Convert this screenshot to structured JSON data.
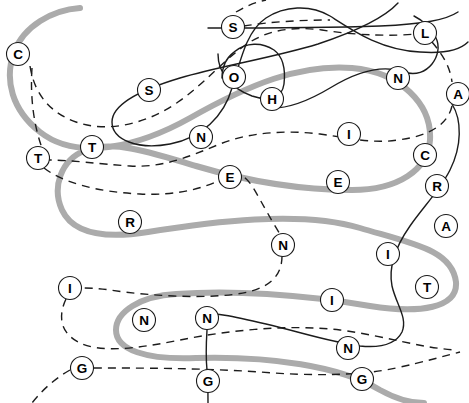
{
  "page": {
    "width": 469,
    "height": 403,
    "background_color": "#ffffff"
  },
  "legend": {
    "gray_thread_color": "#ababab",
    "black_thread_color": "#1c1c1c",
    "node_fill_color": "#ffffff",
    "node_stroke_color": "#1a1a1a"
  },
  "chart_data": {
    "type": "diagram",
    "node_radius": 11.5,
    "nodes": [
      {
        "id": "n01",
        "label": "C",
        "x": 18,
        "y": 54
      },
      {
        "id": "n02",
        "label": "S",
        "x": 233,
        "y": 27
      },
      {
        "id": "n03",
        "label": "L",
        "x": 425,
        "y": 33
      },
      {
        "id": "n04",
        "label": "S",
        "x": 149,
        "y": 90
      },
      {
        "id": "n05",
        "label": "O",
        "x": 234,
        "y": 77
      },
      {
        "id": "n06",
        "label": "H",
        "x": 272,
        "y": 99
      },
      {
        "id": "n07",
        "label": "N",
        "x": 398,
        "y": 78
      },
      {
        "id": "n08",
        "label": "A",
        "x": 458,
        "y": 94
      },
      {
        "id": "n09",
        "label": "T",
        "x": 92,
        "y": 147
      },
      {
        "id": "n10",
        "label": "N",
        "x": 201,
        "y": 137
      },
      {
        "id": "n11",
        "label": "I",
        "x": 349,
        "y": 134
      },
      {
        "id": "n12",
        "label": "T",
        "x": 38,
        "y": 158
      },
      {
        "id": "n13",
        "label": "C",
        "x": 425,
        "y": 155
      },
      {
        "id": "n14",
        "label": "E",
        "x": 230,
        "y": 177
      },
      {
        "id": "n15",
        "label": "E",
        "x": 338,
        "y": 182
      },
      {
        "id": "n16",
        "label": "R",
        "x": 437,
        "y": 186
      },
      {
        "id": "n17",
        "label": "R",
        "x": 130,
        "y": 222
      },
      {
        "id": "n18",
        "label": "A",
        "x": 446,
        "y": 226
      },
      {
        "id": "n19",
        "label": "N",
        "x": 283,
        "y": 245
      },
      {
        "id": "n20",
        "label": "I",
        "x": 388,
        "y": 254
      },
      {
        "id": "n21",
        "label": "I",
        "x": 70,
        "y": 288
      },
      {
        "id": "n22",
        "label": "I",
        "x": 332,
        "y": 300
      },
      {
        "id": "n23",
        "label": "T",
        "x": 427,
        "y": 287
      },
      {
        "id": "n24",
        "label": "N",
        "x": 144,
        "y": 320
      },
      {
        "id": "n25",
        "label": "N",
        "x": 207,
        "y": 318
      },
      {
        "id": "n26",
        "label": "N",
        "x": 348,
        "y": 348
      },
      {
        "id": "n27",
        "label": "G",
        "x": 82,
        "y": 368
      },
      {
        "id": "n28",
        "label": "G",
        "x": 208,
        "y": 381
      },
      {
        "id": "n29",
        "label": "G",
        "x": 362,
        "y": 379
      }
    ],
    "threads": [
      {
        "id": "gray-1",
        "style": "solid",
        "color": "#ababab",
        "width": 6,
        "path": "M 80 8 C 52 10, 24 26, 14 52 C 4 80, 12 110, 40 132 C 78 162, 140 146, 190 118 C 250 84, 300 64, 352 68 C 400 72, 432 104, 430 140 C 428 170, 398 190, 352 190 C 300 190, 250 182, 196 166 C 150 152, 112 140, 86 150 C 60 160, 52 188, 62 210 C 74 236, 110 238, 148 232 C 210 222, 300 210, 360 228 C 414 244, 452 250, 456 282 C 458 308, 420 314, 370 306 C 300 294, 230 290, 176 294 C 140 296, 116 312, 116 330 C 116 350, 146 360, 196 358 C 270 356, 340 366, 380 390 C 398 400, 412 403, 424 403"
      },
      {
        "id": "black-solid-1",
        "style": "solid",
        "color": "#1c1c1c",
        "width": 1.4,
        "path": "M 398 3 C 386 16, 360 30, 318 44 C 272 58, 220 66, 180 78 C 140 90, 112 104, 112 122 C 112 140, 138 150, 170 144 C 202 138, 224 116, 232 88 C 242 54, 248 30, 266 18 C 284 6, 310 4, 330 16 C 352 30, 380 50, 420 52 C 448 54, 462 48, 468 42"
      },
      {
        "id": "black-solid-2",
        "style": "solid",
        "color": "#1c1c1c",
        "width": 1.4,
        "path": "M 208 28 C 250 28, 320 28, 380 26 C 424 24, 446 20, 458 12"
      },
      {
        "id": "black-solid-3",
        "style": "solid",
        "color": "#1c1c1c",
        "width": 1.4,
        "path": "M 218 54 C 218 72, 230 88, 252 96 C 270 102, 282 98, 284 84 C 286 66, 282 56, 274 50 C 262 42, 246 42, 234 52 C 226 58, 222 66, 222 78"
      },
      {
        "id": "black-solid-4",
        "style": "solid",
        "color": "#1c1c1c",
        "width": 1.4,
        "path": "M 266 108 C 288 110, 310 100, 330 88 C 356 72, 382 64, 404 72 C 428 80, 444 54, 436 38 C 430 26, 422 20, 414 16"
      },
      {
        "id": "black-solid-5",
        "style": "solid",
        "color": "#1c1c1c",
        "width": 1.4,
        "path": "M 452 104 C 462 120, 462 146, 450 170 C 440 190, 424 206, 410 226 C 396 246, 388 266, 392 286 C 396 304, 408 318, 402 332 C 396 344, 380 348, 360 346 C 330 342, 300 332, 266 324 C 232 316, 212 312, 200 314"
      },
      {
        "id": "black-solid-6",
        "style": "solid",
        "color": "#1c1c1c",
        "width": 1.4,
        "path": "M 207 330 C 206 346, 206 360, 207 370 C 208 382, 208 394, 208 403"
      },
      {
        "id": "dash-1",
        "style": "dashed",
        "color": "#1c1c1c",
        "width": 1.4,
        "path": "M 30 66 C 34 92, 48 112, 76 122 C 110 134, 150 122, 178 102 C 204 84, 222 62, 244 46 C 266 30, 292 26, 322 30 C 360 36, 396 36, 416 34"
      },
      {
        "id": "dash-2",
        "style": "dashed",
        "color": "#1c1c1c",
        "width": 1.4,
        "path": "M 432 42 C 442 54, 450 66, 452 82"
      },
      {
        "id": "dash-3",
        "style": "dashed",
        "color": "#1c1c1c",
        "width": 1.4,
        "path": "M 452 106 C 448 124, 430 136, 398 140 C 372 144, 350 138, 320 134 C 286 130, 250 132, 220 144 C 190 156, 164 168, 130 166 C 98 164, 72 160, 48 160"
      },
      {
        "id": "dash-4",
        "style": "dashed",
        "color": "#1c1c1c",
        "width": 1.4,
        "path": "M 32 68 C 30 98, 34 126, 42 148"
      },
      {
        "id": "dash-5",
        "style": "dashed",
        "color": "#1c1c1c",
        "width": 1.4,
        "path": "M 44 168 C 62 182, 96 192, 140 194 C 176 196, 206 188, 224 178 C 240 168, 248 178, 258 196 C 268 214, 276 228, 280 234"
      },
      {
        "id": "dash-6",
        "style": "dashed",
        "color": "#1c1c1c",
        "width": 1.4,
        "path": "M 282 256 C 282 274, 272 286, 248 292 C 212 300, 150 296, 110 290 C 96 288, 86 288, 80 288"
      },
      {
        "id": "dash-7",
        "style": "dashed",
        "color": "#1c1c1c",
        "width": 1.4,
        "path": "M 66 299 C 58 316, 60 332, 78 342 C 100 354, 140 348, 180 340 C 230 330, 290 324, 340 330 C 386 336, 420 348, 456 350"
      },
      {
        "id": "dash-8",
        "style": "dashed",
        "color": "#1c1c1c",
        "width": 1.4,
        "path": "M 94 368 C 140 368, 200 368, 260 372 C 310 376, 360 376, 396 368 C 424 362, 444 356, 460 352"
      },
      {
        "id": "dash-9",
        "style": "dashed",
        "color": "#1c1c1c",
        "width": 1.4,
        "path": "M 70 370 C 56 378, 44 388, 32 403"
      },
      {
        "id": "dash-10",
        "style": "dashed",
        "color": "#1c1c1c",
        "width": 1.4,
        "path": "M 236 12 C 246 6, 256 2, 266 0"
      },
      {
        "id": "dash-11",
        "style": "dashed",
        "color": "#1c1c1c",
        "width": 1.4,
        "path": "M 244 26 C 268 22, 300 20, 330 20"
      }
    ]
  }
}
